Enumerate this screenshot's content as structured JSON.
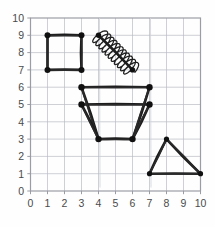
{
  "figure": {
    "title": "",
    "background_color": "#fefefe",
    "grid_color": "#b9bcc4",
    "axis_color": "#9a9da5",
    "ink_color": "#1c1c1c"
  },
  "chart_data": {
    "type": "scatter",
    "title": "",
    "xlabel": "",
    "ylabel": "",
    "xlim": [
      0,
      10
    ],
    "ylim": [
      0,
      10
    ],
    "grid": true,
    "legend": null,
    "xticks": [
      "0",
      "1",
      "2",
      "3",
      "4",
      "5",
      "6",
      "7",
      "8",
      "9",
      "10"
    ],
    "yticks": [
      "0",
      "1",
      "2",
      "3",
      "4",
      "5",
      "6",
      "7",
      "8",
      "9",
      "10"
    ],
    "xtick_values": [
      0,
      1,
      2,
      3,
      4,
      5,
      6,
      7,
      8,
      9,
      10
    ],
    "ytick_values": [
      0,
      1,
      2,
      3,
      4,
      5,
      6,
      7,
      8,
      9,
      10
    ],
    "annotations": [
      "square drawn from (1,7) to (3,9)",
      "coil/spring drawn along diagonal from (4,9) to (6,7)",
      "trapezoid with top edge (3,6)-(7,6), mid edge (3,5)-(7,5), bottom edge (4,3)-(6,3)",
      "triangle with vertices (7,1), (8,3), (10,1)"
    ],
    "shapes": [
      {
        "name": "square",
        "kind": "polygon",
        "closed": true,
        "points": [
          [
            1,
            9
          ],
          [
            3,
            9
          ],
          [
            3,
            7
          ],
          [
            1,
            7
          ]
        ],
        "vertices": [
          [
            1,
            9
          ],
          [
            3,
            9
          ],
          [
            3,
            7
          ],
          [
            1,
            7
          ]
        ]
      },
      {
        "name": "coil-spring",
        "kind": "coil",
        "closed": false,
        "axis_start": [
          4,
          9
        ],
        "axis_end": [
          6,
          7
        ],
        "loops": 11,
        "amplitude": 0.55,
        "vertices": [
          [
            4,
            9
          ],
          [
            6,
            7
          ]
        ]
      },
      {
        "name": "trapezoid",
        "kind": "polyline-group",
        "closed": false,
        "segments": [
          [
            [
              3,
              6
            ],
            [
              7,
              6
            ]
          ],
          [
            [
              3,
              5
            ],
            [
              7,
              5
            ]
          ],
          [
            [
              3,
              6
            ],
            [
              4,
              3
            ]
          ],
          [
            [
              7,
              6
            ],
            [
              6,
              3
            ]
          ],
          [
            [
              3,
              5
            ],
            [
              4,
              3
            ]
          ],
          [
            [
              7,
              5
            ],
            [
              6,
              3
            ]
          ],
          [
            [
              4,
              3
            ],
            [
              6,
              3
            ]
          ]
        ],
        "vertices": [
          [
            3,
            6
          ],
          [
            7,
            6
          ],
          [
            3,
            5
          ],
          [
            7,
            5
          ],
          [
            4,
            3
          ],
          [
            6,
            3
          ]
        ]
      },
      {
        "name": "triangle",
        "kind": "polygon",
        "closed": true,
        "points": [
          [
            7,
            1
          ],
          [
            8,
            3
          ],
          [
            10,
            1
          ]
        ],
        "vertices": [
          [
            7,
            1
          ],
          [
            8,
            3
          ],
          [
            10,
            1
          ]
        ]
      }
    ]
  }
}
